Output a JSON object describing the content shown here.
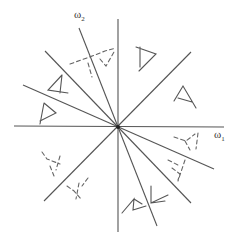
{
  "figure": {
    "type": "frequency-plane-diagram",
    "center": [
      118,
      127
    ],
    "colors": {
      "line": "#555555",
      "solid_glyph": "#555555",
      "dashed_glyph": "#666666",
      "background": "#ffffff"
    }
  },
  "axes": {
    "x_label": "ω",
    "x_label_sub": "1",
    "y_label": "ω",
    "y_label_sub": "2"
  },
  "lines": [
    {
      "id": "axis-horizontal",
      "x1": 14,
      "y1": 126,
      "x2": 224,
      "y2": 127
    },
    {
      "id": "axis-vertical",
      "x1": 118,
      "y1": 19,
      "x2": 118,
      "y2": 232
    },
    {
      "id": "diag-steep-nw-se",
      "x1": 79,
      "y1": 28,
      "x2": 157,
      "y2": 226
    },
    {
      "id": "diag-nw-se",
      "x1": 45,
      "y1": 51,
      "x2": 191,
      "y2": 203
    },
    {
      "id": "diag-shallow-nw-se",
      "x1": 23,
      "y1": 85,
      "x2": 214,
      "y2": 169
    },
    {
      "id": "diag-ne-sw",
      "x1": 191,
      "y1": 52,
      "x2": 44,
      "y2": 201
    }
  ],
  "glyphs": [
    {
      "id": "solid-a-upper-left",
      "style": "solid",
      "points": [
        [
          48,
          90
        ],
        [
          62,
          75
        ],
        [
          60,
          93
        ],
        [
          68,
          94
        ]
      ],
      "path": "M 62 75 L 48 90 L 68 93 M 62 75 L 60 93"
    },
    {
      "id": "solid-a-left",
      "style": "solid",
      "points": [],
      "path": "M 44 103 L 40 124 M 44 103 L 56 113 L 40 121"
    },
    {
      "id": "solid-d-upper-right",
      "style": "solid",
      "path": "M 136 47 L 156 54 L 139 71 M 140 47 L 140 67"
    },
    {
      "id": "solid-a-right",
      "style": "solid",
      "path": "M 174 101 L 183 86 L 196 108 M 178 98 L 192 102"
    },
    {
      "id": "solid-a-bottom-left",
      "style": "solid",
      "path": "M 122 213 L 134 199 L 133 210 L 146 206 M 134 199 L 142 204"
    },
    {
      "id": "solid-a-bottom-right",
      "style": "solid",
      "path": "M 151 186 L 151 203 L 168 195 M 151 203 L 165 201"
    },
    {
      "id": "dashed-upper",
      "style": "dashed",
      "path": "M 70 64 L 95 55 L 105 51 L 116 48 M 88 63 L 92 77 M 100 59 L 106 66 L 114 52"
    },
    {
      "id": "dashed-left",
      "style": "dashed",
      "path": "M 42 152 L 47 159 L 60 164 M 50 166 L 54 176 M 60 156 L 56 170"
    },
    {
      "id": "dashed-lower-left",
      "style": "dashed",
      "path": "M 67 186 L 74 191 L 82 200 M 79 183 L 76 199 M 88 178 L 82 186"
    },
    {
      "id": "dashed-right-upper",
      "style": "dashed",
      "path": "M 174 137 L 186 141 L 195 134 M 198 133 L 196 149 M 185 141 L 190 150"
    },
    {
      "id": "dashed-right-lower",
      "style": "dashed",
      "path": "M 168 160 L 178 165 M 185 160 L 178 181 M 172 168 L 180 174 L 178 180"
    }
  ]
}
